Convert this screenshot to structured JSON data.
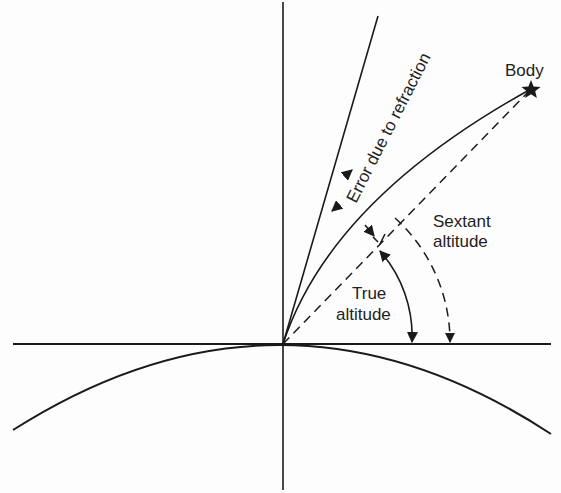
{
  "diagram": {
    "labels": {
      "body": "Body",
      "error": "Error due to refraction",
      "sextant_line1": "Sextant",
      "sextant_line2": "altitude",
      "true_line1": "True",
      "true_line2": "altitude"
    },
    "elements": {
      "zenith_line": "vertical",
      "horizon_line": "horizontal",
      "earth_surface": "arc",
      "apparent_ray": "solid",
      "refracted_light_path": "curved",
      "true_direction": "dashed",
      "true_altitude_arc": "solid-arrow",
      "sextant_altitude_arc": "dashed-arrow",
      "body_marker": "star"
    },
    "colors": {
      "ink": "#1a1a1a",
      "background": "#fdfdfd"
    }
  }
}
